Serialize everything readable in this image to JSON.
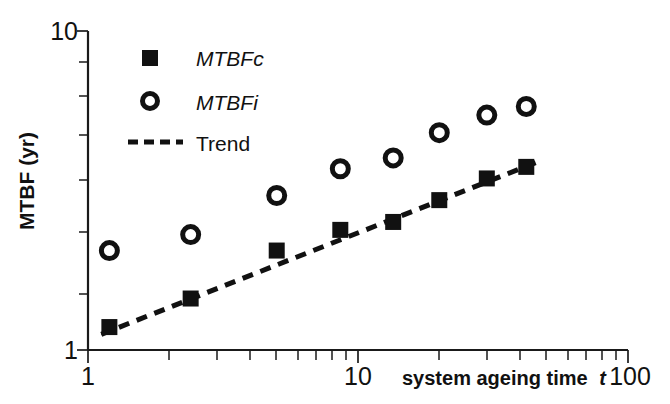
{
  "chart_data": {
    "type": "scatter",
    "title": "",
    "xlabel": "system ageing time t",
    "xlabel_plain": "system ageing time",
    "xlabel_italic": "t",
    "ylabel": "MTBF (yr)",
    "xscale": "log",
    "yscale": "log",
    "xlim": [
      1,
      100
    ],
    "ylim": [
      1,
      10
    ],
    "grid": false,
    "xticks": [
      1,
      10,
      100
    ],
    "xtick_labels": [
      "1",
      "10",
      "100"
    ],
    "yticks": [
      1,
      10
    ],
    "ytick_labels": [
      "1",
      "10"
    ],
    "legend_position": "upper-left-inside",
    "series": [
      {
        "name": "MTBFc",
        "marker": "filled-square",
        "color": "#111111",
        "x": [
          1.2,
          2.4,
          5.0,
          8.6,
          13.5,
          20.0,
          30.0,
          42.0
        ],
        "y": [
          1.18,
          1.45,
          2.05,
          2.38,
          2.52,
          2.95,
          3.45,
          3.75
        ]
      },
      {
        "name": "MTBFi",
        "marker": "open-circle",
        "color": "#111111",
        "x": [
          1.2,
          2.4,
          5.0,
          8.6,
          13.5,
          20.0,
          30.0,
          42.0
        ],
        "y": [
          2.05,
          2.3,
          3.05,
          3.7,
          4.0,
          4.8,
          5.45,
          5.8
        ]
      },
      {
        "name": "Trend",
        "marker": "dashed-line",
        "color": "#111111",
        "x": [
          1.12,
          46.0
        ],
        "y": [
          1.12,
          3.88
        ]
      }
    ]
  },
  "legend": {
    "items": [
      {
        "label": "MTBFc",
        "marker": "filled-square",
        "italic": true
      },
      {
        "label": "MTBFi",
        "marker": "open-circle",
        "italic": true
      },
      {
        "label": "Trend",
        "marker": "dashed-line",
        "italic": false
      }
    ]
  },
  "axes": {
    "y_title": "MTBF (yr)",
    "y_top_label": "10",
    "y_bottom_label": "1",
    "x_left_label": "1",
    "x_mid_label": "10",
    "x_right_label": "100",
    "x_title_plain": "system ageing time",
    "x_title_italic": "t"
  },
  "colors": {
    "ink": "#111111",
    "background": "#ffffff"
  }
}
